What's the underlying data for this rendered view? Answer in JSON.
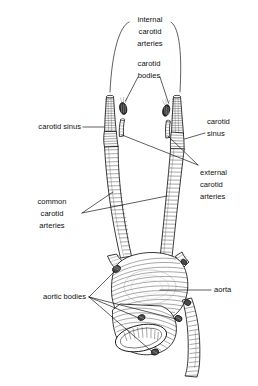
{
  "figure": {
    "background_color": "#ffffff",
    "ink_color": "#111111",
    "width": 258,
    "height": 386
  },
  "labels": {
    "internal_carotid_arteries": {
      "lines": [
        "internal",
        "carotid",
        "arteries"
      ],
      "line1": "internal",
      "line2": "carotid",
      "line3": "arteries"
    },
    "carotid_bodies": {
      "lines": [
        "carotid",
        "bodies"
      ],
      "line1": "carotid",
      "line2": "bodies"
    },
    "carotid_sinus_left": {
      "lines": [
        "carotid sinus"
      ],
      "line1": "carotid sinus"
    },
    "carotid_sinus_right": {
      "lines": [
        "carotid",
        "sinus"
      ],
      "line1": "carotid",
      "line2": "sinus"
    },
    "external_carotid_arteries": {
      "lines": [
        "external",
        "carotid",
        "arteries"
      ],
      "line1": "external",
      "line2": "carotid",
      "line3": "arteries"
    },
    "common_carotid_arteries": {
      "lines": [
        "common",
        "carotid",
        "arteries"
      ],
      "line1": "common",
      "line2": "carotid",
      "line3": "arteries"
    },
    "aortic_bodies": {
      "lines": [
        "aortic bodies"
      ],
      "line1": "aortic bodies"
    },
    "aorta": {
      "lines": [
        "aorta"
      ],
      "line1": "aorta"
    }
  },
  "structures": [
    {
      "name": "internal-carotid-artery-left",
      "side": "left"
    },
    {
      "name": "internal-carotid-artery-right",
      "side": "right"
    },
    {
      "name": "external-carotid-artery-left",
      "side": "left"
    },
    {
      "name": "external-carotid-artery-right",
      "side": "right"
    },
    {
      "name": "carotid-body-left",
      "side": "left"
    },
    {
      "name": "carotid-body-right",
      "side": "right"
    },
    {
      "name": "carotid-sinus-left",
      "side": "left"
    },
    {
      "name": "carotid-sinus-right",
      "side": "right"
    },
    {
      "name": "common-carotid-artery-left",
      "side": "left"
    },
    {
      "name": "common-carotid-artery-right",
      "side": "right"
    },
    {
      "name": "aortic-arch",
      "side": "center"
    },
    {
      "name": "descending-aorta",
      "side": "center"
    },
    {
      "name": "pulmonary-trunk",
      "side": "center"
    },
    {
      "name": "aortic-body-1",
      "side": "left"
    },
    {
      "name": "aortic-body-2",
      "side": "center"
    },
    {
      "name": "aortic-body-3",
      "side": "right"
    },
    {
      "name": "aortic-body-4",
      "side": "right"
    }
  ]
}
